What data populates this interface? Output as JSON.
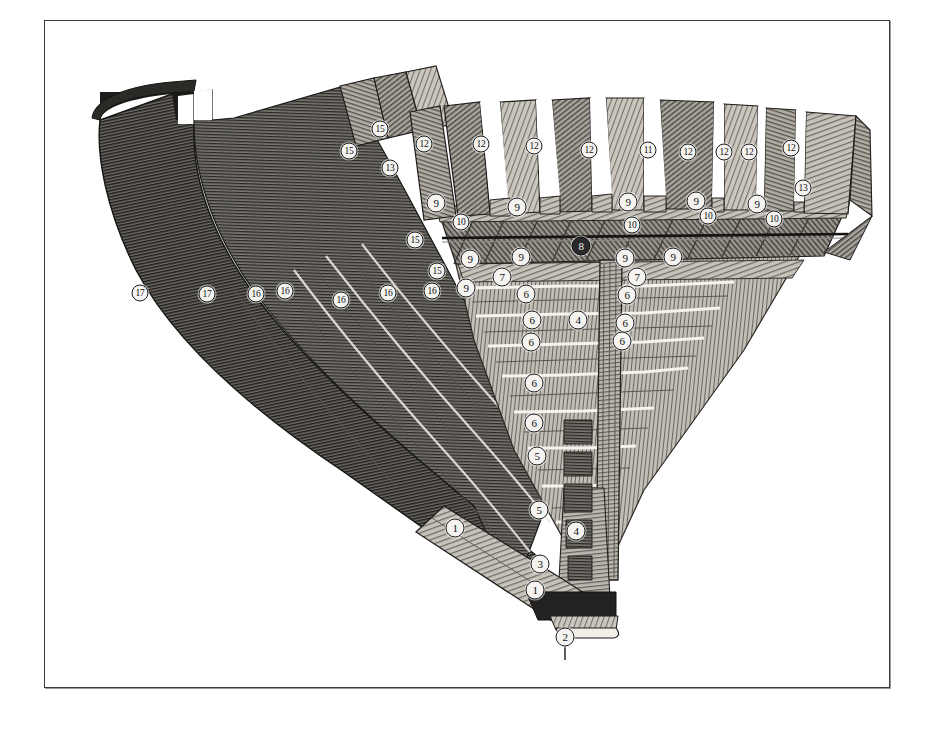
{
  "plate": {
    "title": "Midship section of a wooden ship's hull",
    "medium": "wood engraving",
    "background_color": "#ffffff",
    "border_color": "#3a3a3c",
    "ink_color": "#2b2b2d"
  },
  "callouts": [
    {
      "label": "1",
      "x": 455,
      "y": 528,
      "part": "garboard-strake"
    },
    {
      "label": "1",
      "x": 535,
      "y": 590,
      "part": "keel-plank"
    },
    {
      "label": "2",
      "x": 565,
      "y": 637,
      "part": "false-keel"
    },
    {
      "label": "3",
      "x": 540,
      "y": 564,
      "part": "keel"
    },
    {
      "label": "4",
      "x": 576,
      "y": 531,
      "part": "deadwood"
    },
    {
      "label": "4",
      "x": 578,
      "y": 320,
      "part": "keelson"
    },
    {
      "label": "5",
      "x": 539,
      "y": 510,
      "part": "floor-timber"
    },
    {
      "label": "5",
      "x": 537,
      "y": 456,
      "part": "limber-strake"
    },
    {
      "label": "6",
      "x": 534,
      "y": 423,
      "part": "ceiling-plank"
    },
    {
      "label": "6",
      "x": 534,
      "y": 383,
      "part": "ceiling-plank"
    },
    {
      "label": "6",
      "x": 531,
      "y": 342,
      "part": "ceiling-plank"
    },
    {
      "label": "6",
      "x": 532,
      "y": 320,
      "part": "ceiling-plank"
    },
    {
      "label": "6",
      "x": 526,
      "y": 294,
      "part": "ceiling-plank"
    },
    {
      "label": "6",
      "x": 627,
      "y": 295,
      "part": "ceiling-plank"
    },
    {
      "label": "6",
      "x": 625,
      "y": 323,
      "part": "ceiling-plank"
    },
    {
      "label": "6",
      "x": 622,
      "y": 341,
      "part": "ceiling-plank"
    },
    {
      "label": "7",
      "x": 502,
      "y": 277,
      "part": "thick-stuff"
    },
    {
      "label": "7",
      "x": 637,
      "y": 277,
      "part": "thick-stuff"
    },
    {
      "label": "8",
      "x": 581,
      "y": 246,
      "part": "keelson-bolt",
      "style": "dark"
    },
    {
      "label": "9",
      "x": 436,
      "y": 203,
      "part": "futtock-head"
    },
    {
      "label": "9",
      "x": 517,
      "y": 207,
      "part": "futtock-head"
    },
    {
      "label": "9",
      "x": 628,
      "y": 202,
      "part": "futtock-head"
    },
    {
      "label": "9",
      "x": 696,
      "y": 201,
      "part": "futtock-head"
    },
    {
      "label": "9",
      "x": 757,
      "y": 204,
      "part": "futtock-head"
    },
    {
      "label": "9",
      "x": 470,
      "y": 259,
      "part": "frame-timber"
    },
    {
      "label": "9",
      "x": 521,
      "y": 257,
      "part": "frame-timber"
    },
    {
      "label": "9",
      "x": 625,
      "y": 258,
      "part": "frame-timber"
    },
    {
      "label": "9",
      "x": 673,
      "y": 257,
      "part": "frame-timber"
    },
    {
      "label": "9",
      "x": 466,
      "y": 288,
      "part": "frame-timber"
    },
    {
      "label": "10",
      "x": 461,
      "y": 222,
      "part": "clamp"
    },
    {
      "label": "10",
      "x": 632,
      "y": 225,
      "part": "clamp"
    },
    {
      "label": "10",
      "x": 708,
      "y": 216,
      "part": "clamp"
    },
    {
      "label": "10",
      "x": 774,
      "y": 219,
      "part": "clamp"
    },
    {
      "label": "11",
      "x": 648,
      "y": 150,
      "part": "top-timber"
    },
    {
      "label": "12",
      "x": 424,
      "y": 144,
      "part": "top-timber"
    },
    {
      "label": "12",
      "x": 481,
      "y": 144,
      "part": "top-timber"
    },
    {
      "label": "12",
      "x": 534,
      "y": 146,
      "part": "top-timber"
    },
    {
      "label": "12",
      "x": 589,
      "y": 150,
      "part": "top-timber"
    },
    {
      "label": "12",
      "x": 688,
      "y": 152,
      "part": "top-timber"
    },
    {
      "label": "12",
      "x": 724,
      "y": 152,
      "part": "top-timber"
    },
    {
      "label": "12",
      "x": 749,
      "y": 152,
      "part": "top-timber"
    },
    {
      "label": "12",
      "x": 791,
      "y": 148,
      "part": "top-timber"
    },
    {
      "label": "13",
      "x": 390,
      "y": 168,
      "part": "sheer-rail"
    },
    {
      "label": "13",
      "x": 803,
      "y": 188,
      "part": "sheer-rail"
    },
    {
      "label": "15",
      "x": 349,
      "y": 151,
      "part": "outer-plank"
    },
    {
      "label": "15",
      "x": 380,
      "y": 129,
      "part": "outer-plank"
    },
    {
      "label": "15",
      "x": 415,
      "y": 240,
      "part": "wale"
    },
    {
      "label": "15",
      "x": 437,
      "y": 271,
      "part": "wale"
    },
    {
      "label": "16",
      "x": 256,
      "y": 294,
      "part": "outer-planking"
    },
    {
      "label": "16",
      "x": 285,
      "y": 291,
      "part": "outer-planking"
    },
    {
      "label": "16",
      "x": 341,
      "y": 300,
      "part": "outer-planking"
    },
    {
      "label": "16",
      "x": 388,
      "y": 293,
      "part": "outer-planking"
    },
    {
      "label": "16",
      "x": 432,
      "y": 291,
      "part": "outer-planking"
    },
    {
      "label": "17",
      "x": 140,
      "y": 293,
      "part": "sheathing"
    },
    {
      "label": "17",
      "x": 207,
      "y": 294,
      "part": "sheathing"
    }
  ]
}
